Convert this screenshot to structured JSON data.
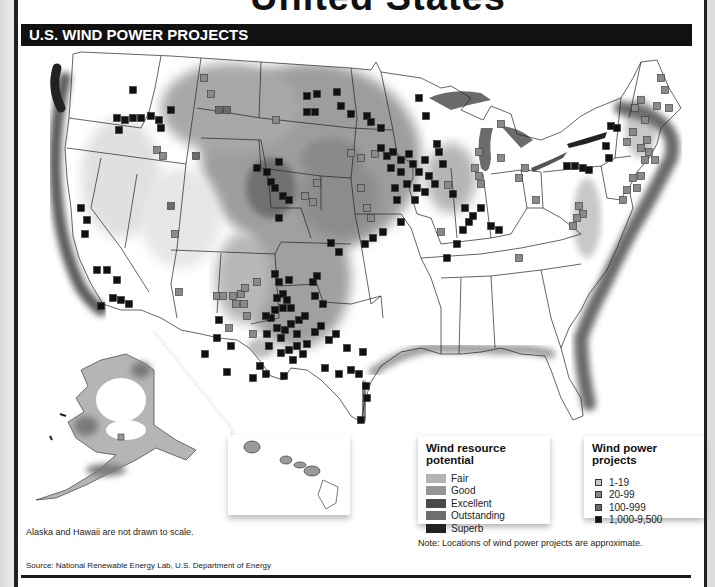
{
  "heading": {
    "partial_title": "United States"
  },
  "banner": {
    "title": "U.S. WIND POWER PROJECTS"
  },
  "legend_resource": {
    "title": "Wind resource potential",
    "items": [
      {
        "label": "Fair",
        "color": "#b3b3b3"
      },
      {
        "label": "Good",
        "color": "#959595"
      },
      {
        "label": "Excellent",
        "color": "#4a4a4a"
      },
      {
        "label": "Outstanding",
        "color": "#6e6e6e"
      },
      {
        "label": "Superb",
        "color": "#222222"
      }
    ]
  },
  "legend_projects": {
    "title": "Wind power projects",
    "items": [
      {
        "label": "1-19",
        "color": "#c8c8c8"
      },
      {
        "label": "20-99",
        "color": "#8a8a8a"
      },
      {
        "label": "100-999",
        "color": "#6a6a6a"
      },
      {
        "label": "1,000-9,500",
        "color": "#111111"
      }
    ]
  },
  "captions": {
    "inset_note": "Alaska and Hawaii are not drawn to scale.",
    "location_note": "Note: Locations of wind power projects are approximate.",
    "source": "Source: National Renewable Energy Lab, U.S. Department of Energy"
  },
  "map": {
    "insets": [
      "Alaska",
      "Hawaii"
    ],
    "project_markers": [
      {
        "x": 112,
        "y": 42,
        "t": 4
      },
      {
        "x": 96,
        "y": 70,
        "t": 4
      },
      {
        "x": 104,
        "y": 72,
        "t": 4
      },
      {
        "x": 112,
        "y": 70,
        "t": 4
      },
      {
        "x": 120,
        "y": 70,
        "t": 4
      },
      {
        "x": 130,
        "y": 68,
        "t": 4
      },
      {
        "x": 138,
        "y": 72,
        "t": 4
      },
      {
        "x": 150,
        "y": 62,
        "t": 4
      },
      {
        "x": 140,
        "y": 80,
        "t": 4
      },
      {
        "x": 98,
        "y": 82,
        "t": 4
      },
      {
        "x": 60,
        "y": 160,
        "t": 4
      },
      {
        "x": 66,
        "y": 172,
        "t": 4
      },
      {
        "x": 64,
        "y": 186,
        "t": 4
      },
      {
        "x": 76,
        "y": 222,
        "t": 4
      },
      {
        "x": 86,
        "y": 222,
        "t": 4
      },
      {
        "x": 96,
        "y": 232,
        "t": 4
      },
      {
        "x": 92,
        "y": 250,
        "t": 4
      },
      {
        "x": 100,
        "y": 252,
        "t": 4
      },
      {
        "x": 108,
        "y": 256,
        "t": 4
      },
      {
        "x": 80,
        "y": 258,
        "t": 4
      },
      {
        "x": 183,
        "y": 30,
        "t": 2
      },
      {
        "x": 190,
        "y": 46,
        "t": 2
      },
      {
        "x": 198,
        "y": 62,
        "t": 3
      },
      {
        "x": 206,
        "y": 62,
        "t": 3
      },
      {
        "x": 255,
        "y": 72,
        "t": 2
      },
      {
        "x": 136,
        "y": 102,
        "t": 2
      },
      {
        "x": 142,
        "y": 108,
        "t": 2
      },
      {
        "x": 175,
        "y": 108,
        "t": 3
      },
      {
        "x": 150,
        "y": 158,
        "t": 3
      },
      {
        "x": 154,
        "y": 186,
        "t": 2
      },
      {
        "x": 286,
        "y": 48,
        "t": 4
      },
      {
        "x": 296,
        "y": 46,
        "t": 4
      },
      {
        "x": 316,
        "y": 44,
        "t": 4
      },
      {
        "x": 286,
        "y": 64,
        "t": 4
      },
      {
        "x": 294,
        "y": 64,
        "t": 4
      },
      {
        "x": 320,
        "y": 58,
        "t": 4
      },
      {
        "x": 330,
        "y": 66,
        "t": 4
      },
      {
        "x": 346,
        "y": 68,
        "t": 4
      },
      {
        "x": 350,
        "y": 74,
        "t": 4
      },
      {
        "x": 236,
        "y": 120,
        "t": 4
      },
      {
        "x": 246,
        "y": 124,
        "t": 4
      },
      {
        "x": 258,
        "y": 114,
        "t": 4
      },
      {
        "x": 250,
        "y": 134,
        "t": 4
      },
      {
        "x": 254,
        "y": 140,
        "t": 4
      },
      {
        "x": 262,
        "y": 148,
        "t": 4
      },
      {
        "x": 268,
        "y": 152,
        "t": 4
      },
      {
        "x": 284,
        "y": 148,
        "t": 2
      },
      {
        "x": 292,
        "y": 154,
        "t": 2
      },
      {
        "x": 258,
        "y": 170,
        "t": 4
      },
      {
        "x": 310,
        "y": 195,
        "t": 4
      },
      {
        "x": 318,
        "y": 204,
        "t": 4
      },
      {
        "x": 344,
        "y": 196,
        "t": 4
      },
      {
        "x": 352,
        "y": 190,
        "t": 4
      },
      {
        "x": 362,
        "y": 184,
        "t": 4
      },
      {
        "x": 380,
        "y": 174,
        "t": 4
      },
      {
        "x": 330,
        "y": 105,
        "t": 2
      },
      {
        "x": 340,
        "y": 110,
        "t": 2
      },
      {
        "x": 354,
        "y": 106,
        "t": 2
      },
      {
        "x": 296,
        "y": 135,
        "t": 2
      },
      {
        "x": 340,
        "y": 140,
        "t": 2
      },
      {
        "x": 360,
        "y": 100,
        "t": 4
      },
      {
        "x": 366,
        "y": 108,
        "t": 4
      },
      {
        "x": 372,
        "y": 104,
        "t": 4
      },
      {
        "x": 380,
        "y": 112,
        "t": 4
      },
      {
        "x": 388,
        "y": 106,
        "t": 4
      },
      {
        "x": 392,
        "y": 116,
        "t": 4
      },
      {
        "x": 380,
        "y": 124,
        "t": 4
      },
      {
        "x": 370,
        "y": 120,
        "t": 4
      },
      {
        "x": 398,
        "y": 124,
        "t": 4
      },
      {
        "x": 404,
        "y": 112,
        "t": 4
      },
      {
        "x": 408,
        "y": 128,
        "t": 4
      },
      {
        "x": 386,
        "y": 136,
        "t": 4
      },
      {
        "x": 396,
        "y": 140,
        "t": 4
      },
      {
        "x": 404,
        "y": 144,
        "t": 4
      },
      {
        "x": 414,
        "y": 136,
        "t": 4
      },
      {
        "x": 374,
        "y": 140,
        "t": 4
      },
      {
        "x": 376,
        "y": 152,
        "t": 4
      },
      {
        "x": 394,
        "y": 152,
        "t": 4
      },
      {
        "x": 418,
        "y": 104,
        "t": 4
      },
      {
        "x": 422,
        "y": 116,
        "t": 4
      },
      {
        "x": 416,
        "y": 96,
        "t": 4
      },
      {
        "x": 405,
        "y": 68,
        "t": 4
      },
      {
        "x": 360,
        "y": 80,
        "t": 4
      },
      {
        "x": 398,
        "y": 50,
        "t": 4
      },
      {
        "x": 427,
        "y": 137,
        "t": 2
      },
      {
        "x": 432,
        "y": 146,
        "t": 4
      },
      {
        "x": 346,
        "y": 160,
        "t": 2
      },
      {
        "x": 350,
        "y": 170,
        "t": 2
      },
      {
        "x": 444,
        "y": 160,
        "t": 4
      },
      {
        "x": 452,
        "y": 168,
        "t": 4
      },
      {
        "x": 460,
        "y": 160,
        "t": 4
      },
      {
        "x": 448,
        "y": 174,
        "t": 4
      },
      {
        "x": 442,
        "y": 182,
        "t": 4
      },
      {
        "x": 470,
        "y": 178,
        "t": 4
      },
      {
        "x": 478,
        "y": 182,
        "t": 4
      },
      {
        "x": 436,
        "y": 196,
        "t": 4
      },
      {
        "x": 426,
        "y": 210,
        "t": 4
      },
      {
        "x": 454,
        "y": 120,
        "t": 2
      },
      {
        "x": 458,
        "y": 128,
        "t": 2
      },
      {
        "x": 460,
        "y": 136,
        "t": 2
      },
      {
        "x": 458,
        "y": 104,
        "t": 2
      },
      {
        "x": 480,
        "y": 110,
        "t": 2
      },
      {
        "x": 480,
        "y": 76,
        "t": 2
      },
      {
        "x": 498,
        "y": 130,
        "t": 2
      },
      {
        "x": 504,
        "y": 120,
        "t": 2
      },
      {
        "x": 515,
        "y": 152,
        "t": 2
      },
      {
        "x": 420,
        "y": 184,
        "t": 2
      },
      {
        "x": 590,
        "y": 78,
        "t": 4
      },
      {
        "x": 596,
        "y": 80,
        "t": 4
      },
      {
        "x": 585,
        "y": 98,
        "t": 4
      },
      {
        "x": 588,
        "y": 110,
        "t": 4
      },
      {
        "x": 546,
        "y": 118,
        "t": 4
      },
      {
        "x": 554,
        "y": 118,
        "t": 4
      },
      {
        "x": 562,
        "y": 120,
        "t": 4
      },
      {
        "x": 568,
        "y": 122,
        "t": 4
      },
      {
        "x": 612,
        "y": 130,
        "t": 2
      },
      {
        "x": 620,
        "y": 128,
        "t": 2
      },
      {
        "x": 616,
        "y": 140,
        "t": 2
      },
      {
        "x": 606,
        "y": 142,
        "t": 2
      },
      {
        "x": 558,
        "y": 158,
        "t": 2
      },
      {
        "x": 562,
        "y": 166,
        "t": 2
      },
      {
        "x": 556,
        "y": 170,
        "t": 2
      },
      {
        "x": 552,
        "y": 178,
        "t": 2
      },
      {
        "x": 640,
        "y": 30,
        "t": 2
      },
      {
        "x": 644,
        "y": 42,
        "t": 2
      },
      {
        "x": 620,
        "y": 52,
        "t": 2
      },
      {
        "x": 614,
        "y": 60,
        "t": 2
      },
      {
        "x": 636,
        "y": 58,
        "t": 2
      },
      {
        "x": 648,
        "y": 60,
        "t": 2
      },
      {
        "x": 624,
        "y": 72,
        "t": 2
      },
      {
        "x": 612,
        "y": 84,
        "t": 2
      },
      {
        "x": 606,
        "y": 94,
        "t": 2
      },
      {
        "x": 626,
        "y": 92,
        "t": 2
      },
      {
        "x": 620,
        "y": 100,
        "t": 2
      },
      {
        "x": 628,
        "y": 104,
        "t": 2
      },
      {
        "x": 624,
        "y": 112,
        "t": 2
      },
      {
        "x": 634,
        "y": 112,
        "t": 2
      },
      {
        "x": 602,
        "y": 152,
        "t": 2
      },
      {
        "x": 498,
        "y": 210,
        "t": 2
      },
      {
        "x": 198,
        "y": 272,
        "t": 4
      },
      {
        "x": 196,
        "y": 290,
        "t": 4
      },
      {
        "x": 210,
        "y": 298,
        "t": 4
      },
      {
        "x": 184,
        "y": 306,
        "t": 4
      },
      {
        "x": 206,
        "y": 324,
        "t": 4
      },
      {
        "x": 248,
        "y": 298,
        "t": 4
      },
      {
        "x": 232,
        "y": 330,
        "t": 4
      },
      {
        "x": 239,
        "y": 318,
        "t": 4
      },
      {
        "x": 245,
        "y": 326,
        "t": 4
      },
      {
        "x": 263,
        "y": 328,
        "t": 4
      },
      {
        "x": 256,
        "y": 250,
        "t": 4
      },
      {
        "x": 262,
        "y": 246,
        "t": 4
      },
      {
        "x": 266,
        "y": 252,
        "t": 4
      },
      {
        "x": 270,
        "y": 260,
        "t": 4
      },
      {
        "x": 262,
        "y": 260,
        "t": 4
      },
      {
        "x": 254,
        "y": 262,
        "t": 4
      },
      {
        "x": 250,
        "y": 270,
        "t": 4
      },
      {
        "x": 256,
        "y": 280,
        "t": 4
      },
      {
        "x": 264,
        "y": 282,
        "t": 4
      },
      {
        "x": 270,
        "y": 276,
        "t": 4
      },
      {
        "x": 278,
        "y": 272,
        "t": 4
      },
      {
        "x": 284,
        "y": 268,
        "t": 4
      },
      {
        "x": 276,
        "y": 286,
        "t": 4
      },
      {
        "x": 260,
        "y": 290,
        "t": 4
      },
      {
        "x": 246,
        "y": 286,
        "t": 4
      },
      {
        "x": 294,
        "y": 248,
        "t": 4
      },
      {
        "x": 302,
        "y": 256,
        "t": 4
      },
      {
        "x": 258,
        "y": 234,
        "t": 4
      },
      {
        "x": 268,
        "y": 232,
        "t": 4
      },
      {
        "x": 292,
        "y": 234,
        "t": 4
      },
      {
        "x": 296,
        "y": 228,
        "t": 4
      },
      {
        "x": 254,
        "y": 226,
        "t": 4
      },
      {
        "x": 245,
        "y": 268,
        "t": 4
      },
      {
        "x": 260,
        "y": 305,
        "t": 4
      },
      {
        "x": 268,
        "y": 302,
        "t": 4
      },
      {
        "x": 276,
        "y": 298,
        "t": 4
      },
      {
        "x": 282,
        "y": 306,
        "t": 4
      },
      {
        "x": 272,
        "y": 312,
        "t": 4
      },
      {
        "x": 286,
        "y": 296,
        "t": 4
      },
      {
        "x": 294,
        "y": 284,
        "t": 4
      },
      {
        "x": 300,
        "y": 278,
        "t": 4
      },
      {
        "x": 308,
        "y": 292,
        "t": 4
      },
      {
        "x": 315,
        "y": 286,
        "t": 4
      },
      {
        "x": 304,
        "y": 320,
        "t": 4
      },
      {
        "x": 318,
        "y": 326,
        "t": 4
      },
      {
        "x": 326,
        "y": 300,
        "t": 4
      },
      {
        "x": 330,
        "y": 322,
        "t": 4
      },
      {
        "x": 338,
        "y": 326,
        "t": 4
      },
      {
        "x": 342,
        "y": 304,
        "t": 4
      },
      {
        "x": 196,
        "y": 248,
        "t": 2
      },
      {
        "x": 212,
        "y": 248,
        "t": 2
      },
      {
        "x": 220,
        "y": 246,
        "t": 2
      },
      {
        "x": 224,
        "y": 240,
        "t": 2
      },
      {
        "x": 215,
        "y": 256,
        "t": 2
      },
      {
        "x": 223,
        "y": 256,
        "t": 2
      },
      {
        "x": 236,
        "y": 234,
        "t": 2
      },
      {
        "x": 226,
        "y": 268,
        "t": 2
      },
      {
        "x": 202,
        "y": 248,
        "t": 2
      },
      {
        "x": 158,
        "y": 244,
        "t": 2
      },
      {
        "x": 208,
        "y": 280,
        "t": 2
      },
      {
        "x": 232,
        "y": 286,
        "t": 2
      },
      {
        "x": 345,
        "y": 338,
        "t": 4
      },
      {
        "x": 346,
        "y": 350,
        "t": 4
      },
      {
        "x": 340,
        "y": 372,
        "t": 4
      }
    ]
  }
}
